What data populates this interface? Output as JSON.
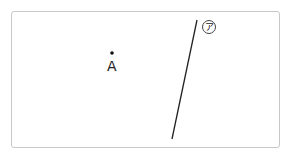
{
  "diagram": {
    "point": {
      "label": "A",
      "x": 112,
      "y": 53
    },
    "line": {
      "label": "ア",
      "x1": 197,
      "y1": 20,
      "x2": 172,
      "y2": 139
    },
    "colors": {
      "border": "#c8c8c8",
      "stroke": "#222222"
    }
  }
}
